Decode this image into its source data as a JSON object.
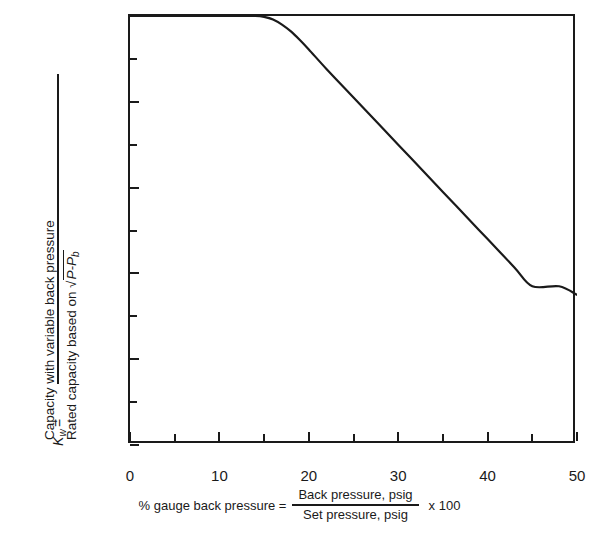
{
  "chart_data": {
    "type": "line",
    "title": "",
    "ylabel_parts": {
      "symbol": "K",
      "symbol_subscript": "w",
      "equals": "=",
      "numerator": "Capacity with variable back pressure",
      "denominator_prefix": "Rated capacity based on",
      "denominator_radical": "√",
      "denominator_radicand": "P-P",
      "denominator_radicand_subscript": "b"
    },
    "xlabel_parts": {
      "lead": "% gauge back pressure =",
      "numerator": "Back pressure, psig",
      "denominator": "Set pressure, psig",
      "tail": "x 100"
    },
    "xlabel": "% gauge back pressure = Back pressure, psig / Set pressure, psig x 100",
    "ylabel": "Kw = Capacity with variable back pressure / Rated capacity based on √(P-Pb)",
    "xlim": [
      0,
      50
    ],
    "ylim": [
      0.5,
      1.0
    ],
    "xticks": [
      0,
      10,
      20,
      30,
      40,
      50
    ],
    "xtick_labels": [
      "0",
      "10",
      "20",
      "30",
      "40",
      "50"
    ],
    "xticks_minor": [
      5,
      15,
      25,
      35,
      45
    ],
    "yticks": [
      0.5,
      0.6,
      0.7,
      0.8,
      0.9,
      1.0
    ],
    "ytick_labels": [
      "0.5",
      "0.6",
      "0.7",
      "0.8",
      "0.9",
      "1.0"
    ],
    "yticks_minor": [
      0.55,
      0.65,
      0.75,
      0.85,
      0.95
    ],
    "grid": false,
    "legend": null,
    "line_color": "#1a1a1a",
    "line_width": 2.2,
    "series": [
      {
        "name": "Kw correction factor",
        "x": [
          0,
          5,
          10,
          12,
          14,
          15,
          16,
          17,
          18,
          19,
          20,
          22,
          25,
          28,
          30,
          33,
          35,
          38,
          40,
          43,
          45,
          48,
          50
        ],
        "y": [
          1.0,
          1.0,
          1.0,
          1.0,
          1.0,
          0.999,
          0.996,
          0.99,
          0.982,
          0.972,
          0.961,
          0.938,
          0.905,
          0.872,
          0.85,
          0.817,
          0.795,
          0.762,
          0.74,
          0.707,
          0.685,
          0.685,
          0.675
        ]
      }
    ],
    "annotations": []
  },
  "axis": {
    "y_tick_labels": [
      "1.0",
      "0.9",
      "0.8",
      "0.7",
      "0.6",
      "0.5"
    ],
    "x_tick_labels": [
      "0",
      "10",
      "20",
      "30",
      "40",
      "50"
    ]
  }
}
